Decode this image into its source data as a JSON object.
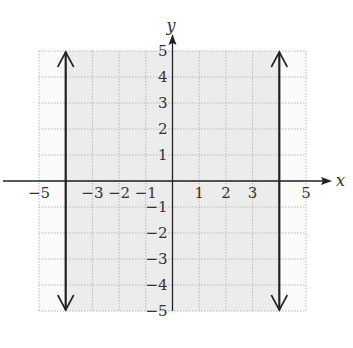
{
  "chart_data": {
    "type": "inequality-region",
    "title": "",
    "xlabel": "x",
    "ylabel": "y",
    "xlim": [
      -5,
      5
    ],
    "ylim": [
      -5,
      5
    ],
    "grid": true,
    "x_tick_labels": [
      "-5",
      "-3",
      "-2",
      "-1",
      "1",
      "2",
      "3",
      "5"
    ],
    "y_tick_labels": [
      "5",
      "4",
      "3",
      "2",
      "1",
      "-1",
      "-2",
      "-3",
      "-4",
      "-5"
    ],
    "boundaries": [
      {
        "type": "vertical-line",
        "x": -4,
        "style": "solid",
        "arrows": "both"
      },
      {
        "type": "vertical-line",
        "x": 4,
        "style": "solid",
        "arrows": "both"
      }
    ],
    "shaded_region": {
      "x_min": -4,
      "x_max": 4,
      "description": "-4 < x < 4 (|x| < 4)"
    },
    "colors": {
      "shade": "#ececec",
      "grid": "#b8b8b8",
      "line": "#222222"
    }
  }
}
